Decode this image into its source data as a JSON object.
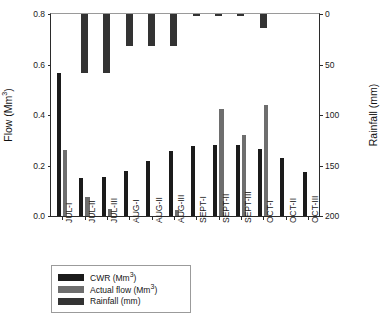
{
  "chart_data": {
    "type": "bar",
    "title": "",
    "subtitle": "",
    "xlabel": "",
    "ylabel": "Flow (Mm3)",
    "ylabel_display": "Flow (Mm",
    "ylabel_sup": "3",
    "ylabel_tail": ")",
    "y2label": "Rainfall (mm)",
    "categories": [
      "JUL-I",
      "JUL-II",
      "JUL-III",
      "AUG-I",
      "AUG-II",
      "AUG-III",
      "SEPT-I",
      "SEPT-II",
      "SEPT-III",
      "OCT-I",
      "OCT-II",
      "OCT-III"
    ],
    "ylim": [
      0.0,
      0.8
    ],
    "y2lim": [
      0,
      200
    ],
    "y2_inverted": true,
    "yticks": [
      "0.0",
      "0.2",
      "0.4",
      "0.6",
      "0.8"
    ],
    "ytick_values": [
      0.0,
      0.2,
      0.4,
      0.6,
      0.8
    ],
    "y2ticks": [
      "0",
      "50",
      "100",
      "150",
      "200"
    ],
    "y2tick_values": [
      0,
      50,
      100,
      150,
      200
    ],
    "grid": false,
    "legend_position": "below-left",
    "series": [
      {
        "name": "CWR (Mm3)",
        "name_display": "CWR (Mm",
        "name_sup": "3",
        "name_tail": ")",
        "axis": "left",
        "color": "#1b1b1b",
        "values": [
          0.565,
          0.15,
          0.155,
          0.178,
          0.217,
          0.257,
          0.276,
          0.282,
          0.283,
          0.265,
          0.228,
          0.173
        ]
      },
      {
        "name": "Actual flow (Mm3)",
        "name_display": "Actual flow (Mm",
        "name_sup": "3",
        "name_tail": ")",
        "axis": "left",
        "color": "#6e6e6e",
        "values": [
          0.263,
          0.077,
          0.026,
          0.0,
          0.0,
          0.024,
          0.0,
          0.423,
          0.32,
          0.438,
          0.0,
          0.0
        ]
      },
      {
        "name": "Rainfall (mm)",
        "name_display": "Rainfall (mm)",
        "name_sup": "",
        "name_tail": "",
        "axis": "right",
        "color": "#333333",
        "values": [
          0,
          58,
          58,
          32,
          32,
          32,
          1.5,
          1.5,
          1.5,
          14,
          0,
          0
        ]
      }
    ]
  }
}
